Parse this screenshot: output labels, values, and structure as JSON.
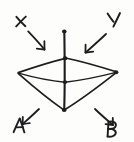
{
  "figure": {
    "ink_color": "#1d1d1f",
    "background_color": "#fdfdfc",
    "width": 134,
    "height": 142
  },
  "labels": [
    {
      "id": "x",
      "text": "X",
      "position": "top-left",
      "x": 16,
      "y": 26
    },
    {
      "id": "y",
      "text": "Y",
      "position": "top-right",
      "x": 107,
      "y": 27
    },
    {
      "id": "a",
      "text": "A",
      "position": "bottom-left",
      "x": 13,
      "y": 132
    },
    {
      "id": "b",
      "text": "B",
      "position": "bottom-right",
      "x": 107,
      "y": 137
    }
  ],
  "arrows": [
    {
      "id": "arrow-x",
      "from_label": "X",
      "direction": "down-right",
      "x1": 28,
      "y1": 31,
      "x2": 44,
      "y2": 49
    },
    {
      "id": "arrow-y",
      "from_label": "Y",
      "direction": "down-left",
      "x1": 106,
      "y1": 34,
      "x2": 86,
      "y2": 52
    },
    {
      "id": "arrow-a",
      "from_label": "A",
      "direction": "down-left",
      "x1": 39,
      "y1": 109,
      "x2": 23,
      "y2": 124
    },
    {
      "id": "arrow-b",
      "from_label": "B",
      "direction": "down-right",
      "x1": 95,
      "y1": 109,
      "x2": 113,
      "y2": 125
    }
  ],
  "vertices": [
    {
      "id": "axis-top",
      "x": 64,
      "y": 31,
      "dot": true
    },
    {
      "id": "rhombus-top",
      "x": 65,
      "y": 58,
      "dot": true
    },
    {
      "id": "left",
      "x": 18,
      "y": 73,
      "dot": false
    },
    {
      "id": "right",
      "x": 116,
      "y": 72,
      "dot": true
    },
    {
      "id": "center-mid",
      "x": 65,
      "y": 82,
      "dot": true
    },
    {
      "id": "bottom-apex",
      "x": 64,
      "y": 110,
      "dot": true
    }
  ],
  "edges": [
    {
      "id": "axis",
      "from": "axis-top",
      "to": "bottom-apex"
    },
    {
      "id": "top-left-edge",
      "from": "rhombus-top",
      "to": "left"
    },
    {
      "id": "top-right-edge",
      "from": "rhombus-top",
      "to": "right"
    },
    {
      "id": "mid-left-edge",
      "from": "center-mid",
      "to": "left"
    },
    {
      "id": "mid-right-edge",
      "from": "center-mid",
      "to": "right"
    },
    {
      "id": "apex-left-edge",
      "from": "bottom-apex",
      "to": "left"
    },
    {
      "id": "apex-right-edge",
      "from": "bottom-apex",
      "to": "right"
    }
  ]
}
